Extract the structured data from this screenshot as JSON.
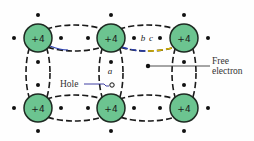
{
  "diagram": {
    "type": "silicon-crystal-lattice-hole-electron",
    "colors": {
      "atom_fill": "#6cc490",
      "atom_stroke": "#1e2a22",
      "bond_dash": "#1a1a1a",
      "electron": "#111111",
      "pointer_line": "#2a2a9a",
      "highlight_blue": "#2b3fb0",
      "highlight_yellow": "#d8b400"
    },
    "atoms": [
      {
        "id": "atom-top-left",
        "label": "+4",
        "cx": 38,
        "cy": 38
      },
      {
        "id": "atom-top-middle",
        "label": "+4",
        "cx": 111,
        "cy": 38
      },
      {
        "id": "atom-top-right",
        "label": "+4",
        "cx": 184,
        "cy": 38
      },
      {
        "id": "atom-bottom-left",
        "label": "+4",
        "cx": 38,
        "cy": 108
      },
      {
        "id": "atom-bottom-middle",
        "label": "+4",
        "cx": 111,
        "cy": 108
      },
      {
        "id": "atom-bottom-right",
        "label": "+4",
        "cx": 184,
        "cy": 108
      }
    ],
    "labels": {
      "a": "a",
      "b": "b",
      "c": "c",
      "hole": "Hole",
      "free_line1": "Free",
      "free_line2": "electron"
    }
  }
}
